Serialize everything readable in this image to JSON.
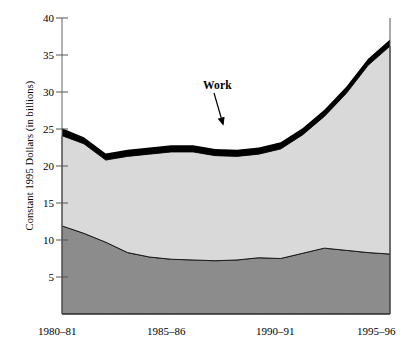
{
  "chart_data": {
    "type": "area",
    "title": "",
    "subtitle": "",
    "xlabel": "",
    "ylabel": "Constant 1995 Dollars (in billions)",
    "stacked": true,
    "grid": false,
    "legend_position": "inline-annotations",
    "ylim": [
      0,
      40
    ],
    "yticks": [
      5,
      10,
      15,
      20,
      25,
      30,
      35,
      40
    ],
    "ytick_labels": [
      "5",
      "10",
      "15",
      "20",
      "25",
      "30",
      "35",
      "40"
    ],
    "x": [
      "1980-81",
      "1981-82",
      "1982-83",
      "1983-84",
      "1984-85",
      "1985-86",
      "1986-87",
      "1987-88",
      "1988-89",
      "1989-90",
      "1990-91",
      "1991-92",
      "1992-93",
      "1993-94",
      "1994-95",
      "1995-96"
    ],
    "xtick_labels": [
      "1980–81",
      "1985–86",
      "1990–91",
      "1995–96"
    ],
    "xtick_positions": [
      "1980-81",
      "1985-86",
      "1990-91",
      "1995-96"
    ],
    "series": [
      {
        "name": "Grants",
        "color": "#8c8c8c",
        "values": [
          11.9,
          10.9,
          9.7,
          8.3,
          7.7,
          7.4,
          7.3,
          7.2,
          7.3,
          7.6,
          7.5,
          8.2,
          8.9,
          8.6,
          8.3,
          8.1
        ]
      },
      {
        "name": "Loans",
        "color": "#d9d9d9",
        "values": [
          12.2,
          12.1,
          11.1,
          13.0,
          13.9,
          14.5,
          14.6,
          14.2,
          14.0,
          14.0,
          14.8,
          16.0,
          17.8,
          21.2,
          25.3,
          28.1
        ]
      },
      {
        "name": "Work",
        "color": "#000000",
        "values": [
          1.0,
          0.9,
          0.9,
          0.9,
          0.9,
          0.9,
          0.9,
          0.9,
          0.9,
          0.9,
          0.9,
          0.9,
          0.9,
          0.9,
          0.9,
          0.9
        ]
      }
    ],
    "totals": [
      25.1,
      23.9,
      21.7,
      22.2,
      22.5,
      22.8,
      22.8,
      22.3,
      22.2,
      22.5,
      23.2,
      25.1,
      27.6,
      30.7,
      34.5,
      37.1
    ],
    "annotations": [
      {
        "text": "Work",
        "target_x": "1988-89",
        "target_value": 22.6
      },
      {
        "text": "Loans",
        "x": "1986-87",
        "value": 17.0
      },
      {
        "text": "Grants",
        "x": "1986-87",
        "value": 4.8
      }
    ]
  },
  "labels": {
    "y_axis_title": "Constant 1995 Dollars (in billions)",
    "work": "Work",
    "loans": "Loans",
    "grants": "Grants",
    "y": {
      "t40": "40",
      "t35": "35",
      "t30": "30",
      "t25": "25",
      "t20": "20",
      "t15": "15",
      "t10": "10",
      "t5": "5"
    },
    "x": {
      "x1": "1980–81",
      "x2": "1985–86",
      "x3": "1990–91",
      "x4": "1995–96"
    }
  },
  "colors": {
    "grants_fill": "#8c8c8c",
    "loans_fill": "#d9d9d9",
    "work_fill": "#000000",
    "axis": "#555555",
    "text": "#000000"
  }
}
